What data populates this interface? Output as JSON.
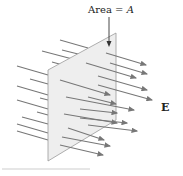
{
  "diagram": {
    "area_label_prefix": "Area = ",
    "area_label_var": "A",
    "field_label": "E",
    "colors": {
      "plane_fill": "#eeeeee",
      "plane_edge": "#9a9a9a",
      "field_lines": "#777777"
    }
  }
}
